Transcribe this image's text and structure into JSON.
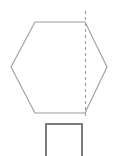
{
  "figure": {
    "name": "hexagonal-prism-cross-section",
    "canvas": {
      "width": 122,
      "height": 156,
      "background": "#ffffff"
    },
    "shapes": {
      "hexagon": {
        "label": "hexagon",
        "points": "35,22 85,22 107,67 85,113 35,113 11,67",
        "stroke": "#9c9c9c",
        "stroke_width": 1.1,
        "fill": "none",
        "vertices": [
          {
            "x": 35,
            "y": 22
          },
          {
            "x": 85,
            "y": 22
          },
          {
            "x": 107,
            "y": 67
          },
          {
            "x": 85,
            "y": 113
          },
          {
            "x": 35,
            "y": 113
          },
          {
            "x": 11,
            "y": 67
          }
        ]
      },
      "cut_line": {
        "label": "dashed-cut-line",
        "x1": 85.5,
        "y1": 11,
        "x2": 85.5,
        "y2": 119,
        "stroke": "#9c9c9c",
        "stroke_width": 1.1,
        "dash_pattern": "3 3"
      },
      "cross_section_rect": {
        "label": "cross-section-rectangle",
        "x": 46,
        "y": 124,
        "width": 36,
        "height": 36,
        "stroke": "#5a5a5a",
        "stroke_width": 1.6,
        "fill": "none",
        "clipped_at_bottom": true
      }
    }
  }
}
